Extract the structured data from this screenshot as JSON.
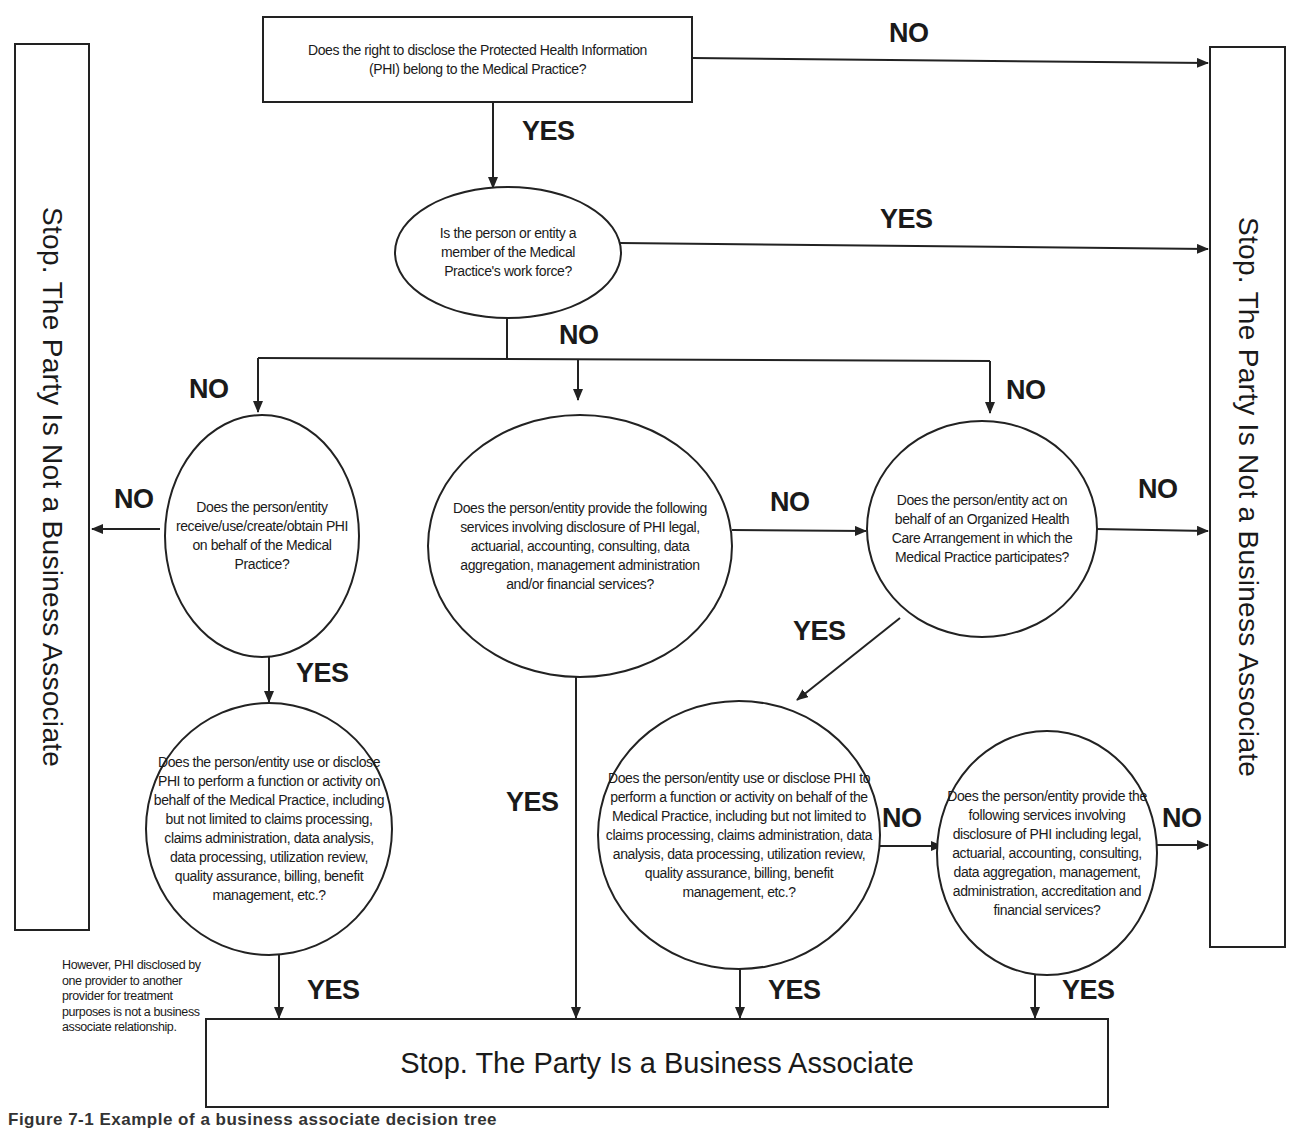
{
  "terminals": {
    "not_ba_left": "Stop.  The Party Is Not a Business Associate",
    "not_ba_right": "Stop.  The Party Is Not a Business Associate",
    "is_ba": "Stop.  The Party Is a Business Associate"
  },
  "questions": {
    "q1": "Does the right to disclose the Protected Health Information (PHI) belong to the Medical Practice?",
    "q2": "Is the person or entity a member of the Medical Practice's work force?",
    "q3": "Does the person/entity receive/use/create/obtain PHI on behalf of the Medical Practice?",
    "q4": "Does the person/entity provide the following services involving disclosure of PHI legal, actuarial, accounting, consulting, data aggregation, management administration and/or financial services?",
    "q5": "Does the person/entity act on behalf of an Organized Health Care Arrangement in which the Medical Practice participates?",
    "q6": "Does the person/entity use or disclose PHI to perform a function or activity on behalf of the Medical Practice, including but not limited to claims processing, claims administration, data analysis, data processing, utilization review, quality assurance, billing, benefit management, etc.?",
    "q7": "Does the person/entity use or disclose PHI to perform a function or activity on behalf of the Medical Practice, including but not limited to claims processing, claims administration, data analysis, data processing, utilization review, quality assurance, billing, benefit management, etc.?",
    "q8": "Does the person/entity provide the following  services involving disclosure of PHI including legal, actuarial, accounting, consulting, data aggregation, management, administration, accreditation and financial services?"
  },
  "labels": {
    "q1_no": "NO",
    "q1_yes": "YES",
    "q2_yes": "YES",
    "q2_no": "NO",
    "branch_left_no": "NO",
    "branch_right_no": "NO",
    "q3_no": "NO",
    "q3_yes": "YES",
    "q4_no": "NO",
    "q4_yes": "YES",
    "q5_no": "NO",
    "q5_yes": "YES",
    "q6_yes": "YES",
    "q7_no": "NO",
    "q7_yes": "YES",
    "q8_no": "NO",
    "q8_yes": "YES"
  },
  "note": "However, PHI disclosed by one provider to another provider for treatment purposes is not a business associate relationship.",
  "caption": "Figure 7-1  Example of a business associate decision tree"
}
